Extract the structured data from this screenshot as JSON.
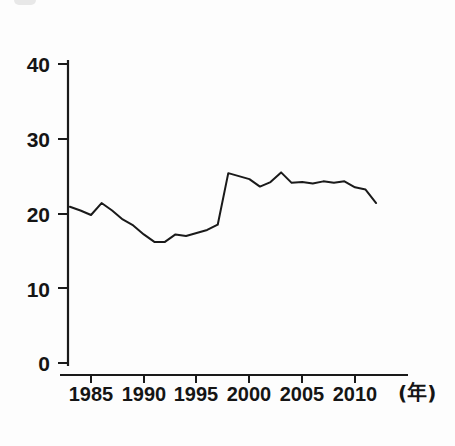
{
  "chart_data": {
    "type": "line",
    "title": "",
    "xlabel": "(年)",
    "ylabel": "",
    "x": [
      1983,
      1984,
      1985,
      1986,
      1987,
      1988,
      1989,
      1990,
      1991,
      1992,
      1993,
      1994,
      1995,
      1996,
      1997,
      1998,
      1999,
      2000,
      2001,
      2002,
      2003,
      2004,
      2005,
      2006,
      2007,
      2008,
      2009,
      2010,
      2011,
      2012
    ],
    "values": [
      20.9,
      20.4,
      19.8,
      21.4,
      20.4,
      19.2,
      18.4,
      17.2,
      16.2,
      16.2,
      17.2,
      17.0,
      17.4,
      17.8,
      18.5,
      25.4,
      25.0,
      24.6,
      23.6,
      24.2,
      25.5,
      24.1,
      24.2,
      24.0,
      24.3,
      24.1,
      24.3,
      23.5,
      23.2,
      21.4
    ],
    "xlim": [
      1983,
      2012
    ],
    "ylim": [
      0,
      40
    ],
    "yticks": [
      0,
      10,
      20,
      30,
      40
    ],
    "ytick_labels": [
      "0",
      "10",
      "20",
      "30",
      "40"
    ],
    "xticks": [
      1985,
      1990,
      1995,
      2000,
      2005,
      2010
    ],
    "xtick_labels": [
      "1985",
      "1990",
      "1995",
      "2000",
      "2005",
      "2010"
    ],
    "grid": false,
    "legend": null,
    "line_color": "#1a1a1a",
    "line_width": 2,
    "axis_color": "#1a1a1a",
    "background": "#ffffff"
  },
  "axes": {
    "y_ticks": [
      {
        "label": "40",
        "value": 40
      },
      {
        "label": "30",
        "value": 30
      },
      {
        "label": "20",
        "value": 20
      },
      {
        "label": "10",
        "value": 10
      },
      {
        "label": "0",
        "value": 0
      }
    ],
    "x_ticks": [
      {
        "label": "1985",
        "value": 1985
      },
      {
        "label": "1990",
        "value": 1990
      },
      {
        "label": "1995",
        "value": 1995
      },
      {
        "label": "2000",
        "value": 2000
      },
      {
        "label": "2005",
        "value": 2005
      },
      {
        "label": "2010",
        "value": 2010
      }
    ],
    "x_unit": "(年)"
  }
}
